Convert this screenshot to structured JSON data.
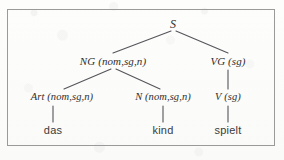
{
  "figure": {
    "kind": "syntax-parse-tree",
    "sentence": "das kind spielt",
    "border_color": "#9a9a9a",
    "background_color": "#fbfbfa",
    "ink_color": "#2e2e2e",
    "line_color": "#55555a"
  },
  "tree": {
    "root": {
      "label": "S",
      "x": 173,
      "y": 26
    },
    "level2": [
      {
        "label": "NG (nom,sg,n)",
        "x": 113,
        "y": 64
      },
      {
        "label": "VG (sg)",
        "x": 228,
        "y": 64
      }
    ],
    "level3": [
      {
        "label": "Art (nom,sg,n)",
        "x": 62,
        "y": 99
      },
      {
        "label": "N (nom,sg,n)",
        "x": 163,
        "y": 99
      },
      {
        "label": "V (sg)",
        "x": 228,
        "y": 99
      }
    ],
    "leaves": [
      {
        "label": "das",
        "x": 53,
        "y": 132
      },
      {
        "label": "kind",
        "x": 163,
        "y": 132
      },
      {
        "label": "spielt",
        "x": 228,
        "y": 132
      }
    ],
    "edges": [
      {
        "from": "S",
        "to": "NG",
        "x1": 171,
        "y1": 31,
        "x2": 113,
        "y2": 53
      },
      {
        "from": "S",
        "to": "VG",
        "x1": 176,
        "y1": 31,
        "x2": 228,
        "y2": 53
      },
      {
        "from": "NG",
        "to": "Art",
        "x1": 111,
        "y1": 69,
        "x2": 64,
        "y2": 89
      },
      {
        "from": "NG",
        "to": "N",
        "x1": 116,
        "y1": 69,
        "x2": 160,
        "y2": 89
      },
      {
        "from": "VG",
        "to": "V",
        "x1": 228,
        "y1": 70,
        "x2": 228,
        "y2": 89
      },
      {
        "from": "Art",
        "to": "das",
        "x1": 53,
        "y1": 105,
        "x2": 53,
        "y2": 122
      },
      {
        "from": "N",
        "to": "kind",
        "x1": 163,
        "y1": 105,
        "x2": 163,
        "y2": 122
      },
      {
        "from": "V",
        "to": "spielt",
        "x1": 228,
        "y1": 105,
        "x2": 228,
        "y2": 122
      }
    ]
  }
}
